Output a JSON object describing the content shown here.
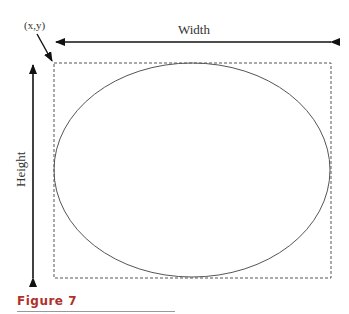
{
  "diagram": {
    "origin_label": "(x,y)",
    "width_label": "Width",
    "height_label": "Height",
    "caption": "Figure 7",
    "caption_color": "#b0302a",
    "rect": {
      "x": 54,
      "y": 63,
      "w": 277,
      "h": 215
    },
    "ellipse": {
      "cx": 192,
      "cy": 170,
      "rx": 138,
      "ry": 107
    }
  }
}
